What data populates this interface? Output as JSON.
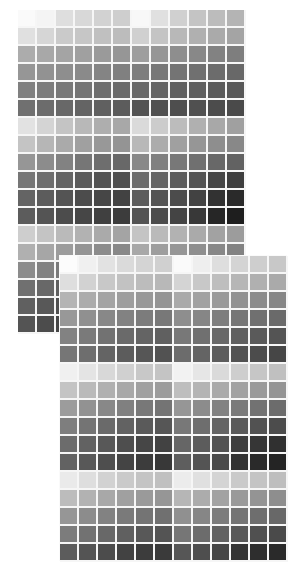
{
  "image": {
    "description": "Photo of two overlapping printed grayscale tone swatch sheets",
    "width": 306,
    "height": 546,
    "background": "#ffffff"
  },
  "sheets": [
    {
      "id": "sheet1",
      "columns": 12,
      "block_rows": [
        [
          250,
          244,
          222,
          216,
          210,
          206,
          248,
          224,
          208,
          196,
          188,
          180
        ],
        [
          224,
          214,
          202,
          198,
          192,
          188,
          208,
          196,
          184,
          176,
          170,
          164
        ],
        [
          172,
          168,
          164,
          160,
          154,
          150,
          158,
          150,
          142,
          136,
          130,
          126
        ],
        [
          150,
          146,
          142,
          138,
          132,
          128,
          126,
          120,
          116,
          112,
          108,
          104
        ],
        [
          128,
          124,
          120,
          116,
          110,
          106,
          104,
          100,
          96,
          94,
          90,
          88
        ],
        [
          112,
          108,
          104,
          100,
          96,
          92,
          84,
          80,
          78,
          80,
          76,
          74
        ],
        [
          226,
          212,
          196,
          184,
          174,
          168,
          218,
          204,
          188,
          176,
          168,
          160
        ],
        [
          196,
          182,
          170,
          160,
          152,
          148,
          184,
          172,
          160,
          150,
          142,
          136
        ],
        [
          150,
          140,
          130,
          118,
          110,
          104,
          136,
          128,
          120,
          112,
          104,
          98
        ],
        [
          118,
          110,
          100,
          90,
          82,
          78,
          108,
          100,
          92,
          84,
          70,
          62
        ],
        [
          100,
          92,
          84,
          76,
          70,
          66,
          92,
          84,
          76,
          66,
          50,
          42
        ],
        [
          92,
          84,
          76,
          70,
          64,
          60,
          84,
          76,
          68,
          56,
          38,
          30
        ],
        [
          206,
          196,
          186,
          178,
          170,
          164,
          196,
          186,
          178,
          170,
          162,
          156
        ],
        [
          176,
          166,
          156,
          148,
          140,
          136,
          168,
          158,
          150,
          142,
          136,
          130
        ],
        [
          140,
          130,
          122,
          114,
          108,
          102,
          132,
          124,
          116,
          108,
          102,
          98
        ],
        [
          112,
          104,
          96,
          88,
          82,
          78,
          104,
          96,
          88,
          82,
          76,
          72
        ],
        [
          96,
          88,
          80,
          72,
          66,
          62,
          88,
          80,
          72,
          66,
          60,
          56
        ],
        [
          84,
          76,
          70,
          64,
          58,
          54,
          76,
          70,
          64,
          58,
          52,
          48
        ]
      ]
    },
    {
      "id": "sheet2",
      "columns": 12,
      "block_rows": [
        [
          252,
          240,
          226,
          218,
          212,
          208,
          250,
          238,
          222,
          212,
          206,
          200
        ],
        [
          222,
          210,
          200,
          194,
          188,
          184,
          212,
          200,
          190,
          182,
          176,
          170
        ],
        [
          180,
          172,
          164,
          158,
          152,
          148,
          170,
          162,
          154,
          146,
          140,
          134
        ],
        [
          152,
          144,
          136,
          130,
          124,
          120,
          142,
          134,
          126,
          118,
          112,
          106
        ],
        [
          130,
          122,
          114,
          106,
          100,
          96,
          120,
          112,
          104,
          96,
          90,
          84
        ],
        [
          118,
          110,
          100,
          92,
          86,
          82,
          108,
          100,
          92,
          82,
          76,
          70
        ],
        [
          240,
          228,
          216,
          208,
          200,
          196,
          242,
          230,
          218,
          206,
          198,
          192
        ],
        [
          196,
          186,
          176,
          168,
          160,
          156,
          190,
          180,
          170,
          162,
          154,
          148
        ],
        [
          156,
          146,
          136,
          128,
          120,
          116,
          150,
          140,
          130,
          122,
          114,
          108
        ],
        [
          126,
          116,
          106,
          98,
          90,
          86,
          120,
          110,
          100,
          90,
          82,
          76
        ],
        [
          108,
          98,
          88,
          78,
          70,
          66,
          102,
          92,
          82,
          62,
          54,
          48
        ],
        [
          98,
          88,
          78,
          68,
          60,
          56,
          94,
          84,
          74,
          50,
          42,
          36
        ],
        [
          234,
          222,
          210,
          202,
          196,
          192,
          236,
          224,
          212,
          202,
          196,
          190
        ],
        [
          188,
          178,
          168,
          160,
          154,
          150,
          182,
          172,
          162,
          154,
          148,
          142
        ],
        [
          150,
          140,
          130,
          122,
          116,
          112,
          144,
          134,
          124,
          116,
          110,
          104
        ],
        [
          124,
          114,
          104,
          96,
          88,
          84,
          118,
          108,
          98,
          88,
          80,
          74
        ],
        [
          92,
          84,
          76,
          66,
          60,
          58,
          86,
          78,
          70,
          52,
          46,
          42
        ]
      ]
    }
  ]
}
